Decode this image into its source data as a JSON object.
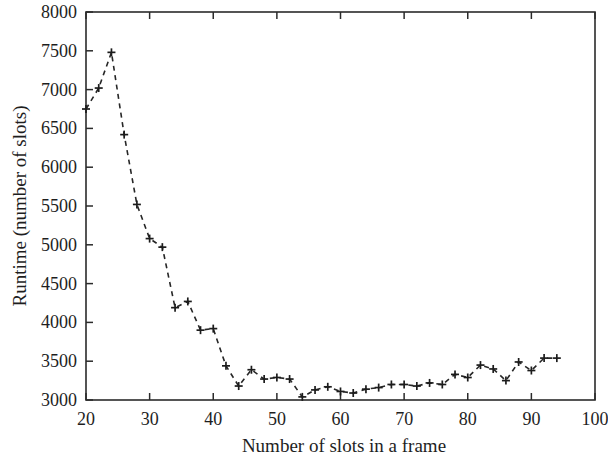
{
  "chart_data": {
    "type": "line",
    "title": "",
    "xlabel": "Number of slots in a frame",
    "ylabel": "Runtime (number of slots)",
    "xlim": [
      20,
      100
    ],
    "ylim": [
      3000,
      8000
    ],
    "xticks": [
      20,
      30,
      40,
      50,
      60,
      70,
      80,
      90,
      100
    ],
    "yticks": [
      3000,
      3500,
      4000,
      4500,
      5000,
      5500,
      6000,
      6500,
      7000,
      7500,
      8000
    ],
    "xtick_labels": [
      "20",
      "30",
      "40",
      "50",
      "60",
      "70",
      "80",
      "90",
      "100"
    ],
    "ytick_labels": [
      "3000",
      "3500",
      "4000",
      "4500",
      "5000",
      "5500",
      "6000",
      "6500",
      "7000",
      "7500",
      "8000"
    ],
    "grid": false,
    "legend": null,
    "line_style": "dashed",
    "marker": "plus",
    "series": [
      {
        "name": "Runtime",
        "x": [
          20,
          22,
          24,
          26,
          28,
          30,
          32,
          34,
          36,
          38,
          40,
          42,
          44,
          46,
          48,
          50,
          52,
          54,
          56,
          58,
          60,
          62,
          64,
          66,
          68,
          70,
          72,
          74,
          76,
          78,
          80,
          82,
          84,
          86,
          88,
          90,
          92,
          94
        ],
        "values": [
          6750,
          7020,
          7480,
          6420,
          5520,
          5080,
          4970,
          4190,
          4270,
          3900,
          3920,
          3440,
          3180,
          3390,
          3270,
          3290,
          3270,
          3040,
          3130,
          3170,
          3110,
          3090,
          3140,
          3160,
          3200,
          3200,
          3180,
          3220,
          3200,
          3330,
          3290,
          3450,
          3400,
          3250,
          3490,
          3380,
          3540,
          3540
        ]
      }
    ]
  },
  "axes": {
    "x_axis_name": "x-axis",
    "y_axis_name": "y-axis"
  }
}
